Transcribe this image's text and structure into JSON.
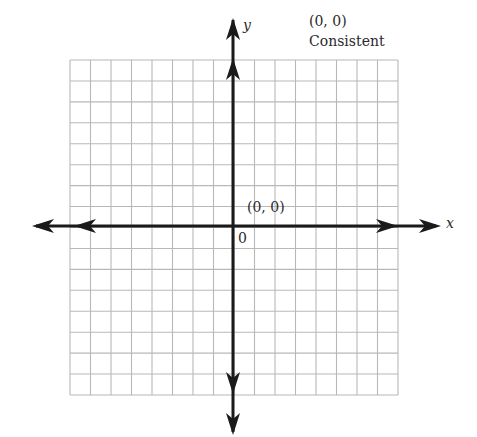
{
  "figure": {
    "type": "coordinate-grid",
    "annotation": {
      "point": "(0, 0)",
      "classification": "Consistent"
    },
    "axes": {
      "x_label": "x",
      "y_label": "y",
      "origin_label": "0"
    },
    "point_label": "(0, 0)",
    "grid": {
      "cells_x": 16,
      "cells_y": 16,
      "left": 70,
      "top": 60,
      "right": 398,
      "bottom": 395,
      "origin_px": [
        233,
        226
      ]
    },
    "colors": {
      "grid": "#b8b8b8",
      "axis": "#1a1a1a",
      "text": "#2a2a2a"
    }
  }
}
